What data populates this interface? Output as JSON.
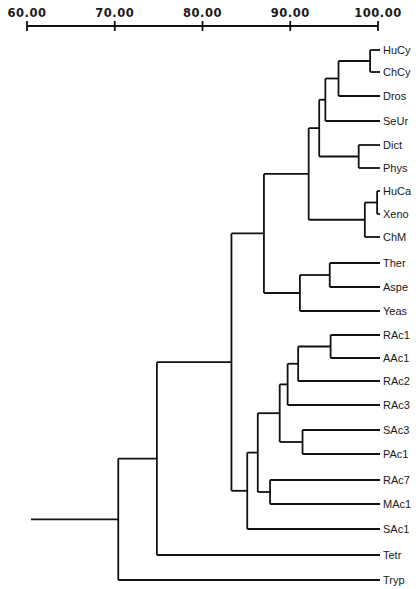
{
  "axis": {
    "ticks": [
      {
        "value": 60,
        "label": "60.00"
      },
      {
        "value": 70,
        "label": "70.00"
      },
      {
        "value": 80,
        "label": "80.00"
      },
      {
        "value": 90,
        "label": "90.00"
      },
      {
        "value": 100,
        "label": "100.00"
      }
    ],
    "min": 60,
    "max": 100
  },
  "leaves": [
    {
      "id": "HuCy",
      "label": "HuCy"
    },
    {
      "id": "ChCy",
      "label": "ChCy"
    },
    {
      "id": "Dros",
      "label": "Dros"
    },
    {
      "id": "SeUr",
      "label": "SeUr"
    },
    {
      "id": "Dict",
      "label": "Dict"
    },
    {
      "id": "Phys",
      "label": "Phys"
    },
    {
      "id": "HuCa",
      "label": "HuCa"
    },
    {
      "id": "Xeno",
      "label": "Xeno"
    },
    {
      "id": "ChM",
      "label": "ChM"
    },
    {
      "id": "Ther",
      "label": "Ther"
    },
    {
      "id": "Aspe",
      "label": "Aspe"
    },
    {
      "id": "Yeas",
      "label": "Yeas"
    },
    {
      "id": "RAc1",
      "label": "RAc1"
    },
    {
      "id": "AAc1",
      "label": "AAc1"
    },
    {
      "id": "RAc2",
      "label": "RAc2"
    },
    {
      "id": "RAc3",
      "label": "RAc3"
    },
    {
      "id": "SAc3",
      "label": "SAc3"
    },
    {
      "id": "PAc1",
      "label": "PAc1"
    },
    {
      "id": "RAc7",
      "label": "RAc7"
    },
    {
      "id": "MAc1",
      "label": "MAc1"
    },
    {
      "id": "SAc1",
      "label": "SAc1"
    },
    {
      "id": "Tetr",
      "label": "Tetr"
    },
    {
      "id": "Tryp",
      "label": "Tryp"
    }
  ],
  "tree": {
    "value": 70.4,
    "children": [
      {
        "value": 74.8,
        "children": [
          {
            "value": 83.3,
            "children": [
              {
                "value": 87.0,
                "children": [
                  {
                    "value": 92.1,
                    "children": [
                      {
                        "value": 93.3,
                        "children": [
                          {
                            "value": 94.0,
                            "children": [
                              {
                                "value": 95.5,
                                "children": [
                                  {
                                    "value": 99.1,
                                    "children": [
                                      {
                                        "leaf": "HuCy"
                                      },
                                      {
                                        "leaf": "ChCy"
                                      }
                                    ]
                                  },
                                  {
                                    "leaf": "Dros"
                                  }
                                ]
                              },
                              {
                                "leaf": "SeUr"
                              }
                            ]
                          },
                          {
                            "value": 97.8,
                            "children": [
                              {
                                "leaf": "Dict"
                              },
                              {
                                "leaf": "Phys"
                              }
                            ]
                          }
                        ]
                      },
                      {
                        "value": 98.5,
                        "children": [
                          {
                            "value": 99.9,
                            "children": [
                              {
                                "leaf": "HuCa"
                              },
                              {
                                "leaf": "Xeno"
                              }
                            ]
                          },
                          {
                            "leaf": "ChM"
                          }
                        ]
                      }
                    ]
                  },
                  {
                    "value": 91.1,
                    "children": [
                      {
                        "value": 94.5,
                        "children": [
                          {
                            "leaf": "Ther"
                          },
                          {
                            "leaf": "Aspe"
                          }
                        ]
                      },
                      {
                        "leaf": "Yeas"
                      }
                    ]
                  }
                ]
              },
              {
                "value": 85.1,
                "children": [
                  {
                    "value": 86.3,
                    "children": [
                      {
                        "value": 88.8,
                        "children": [
                          {
                            "value": 89.7,
                            "children": [
                              {
                                "value": 90.9,
                                "children": [
                                  {
                                    "value": 94.6,
                                    "children": [
                                      {
                                        "leaf": "RAc1"
                                      },
                                      {
                                        "leaf": "AAc1"
                                      }
                                    ]
                                  },
                                  {
                                    "leaf": "RAc2"
                                  }
                                ]
                              },
                              {
                                "leaf": "RAc3"
                              }
                            ]
                          },
                          {
                            "value": 91.4,
                            "children": [
                              {
                                "leaf": "SAc3"
                              },
                              {
                                "leaf": "PAc1"
                              }
                            ]
                          }
                        ]
                      },
                      {
                        "value": 87.7,
                        "children": [
                          {
                            "leaf": "RAc7"
                          },
                          {
                            "leaf": "MAc1"
                          }
                        ]
                      }
                    ]
                  },
                  {
                    "leaf": "SAc1"
                  }
                ]
              }
            ]
          },
          {
            "leaf": "Tetr"
          }
        ]
      },
      {
        "leaf": "Tryp"
      }
    ]
  },
  "layout": {
    "x_at_60": 27,
    "x_at_100": 378,
    "axis_y": 26,
    "tick_label_y": 17,
    "leaf_end_x": 380,
    "label_x": 383,
    "root_stem_x": 31,
    "leaf_y": {
      "HuCy": 50,
      "ChCy": 72,
      "Dros": 96,
      "SeUr": 121,
      "Dict": 145,
      "Phys": 168,
      "HuCa": 191,
      "Xeno": 214,
      "ChM": 237,
      "Ther": 263,
      "Aspe": 287,
      "Yeas": 311,
      "RAc1": 335,
      "AAc1": 358,
      "RAc2": 381,
      "RAc3": 405,
      "SAc3": 430,
      "PAc1": 454,
      "RAc7": 480,
      "MAc1": 504,
      "SAc1": 529,
      "Tetr": 555,
      "Tryp": 580
    }
  },
  "colors": {
    "line": "#111111",
    "text": "#1a1a1a",
    "background": "#ffffff"
  }
}
